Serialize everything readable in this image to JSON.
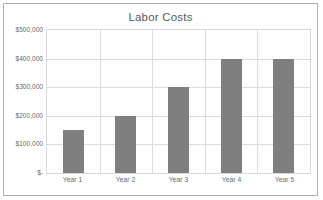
{
  "chart_data": {
    "type": "bar",
    "title": "Labor Costs",
    "xlabel": "",
    "ylabel": "",
    "categories": [
      "Year 1",
      "Year 2",
      "Year 3",
      "Year 4",
      "Year 5"
    ],
    "values": [
      150000,
      200000,
      300000,
      400000,
      400000
    ],
    "ylim": [
      0,
      500000
    ],
    "ytick_values": [
      0,
      100000,
      200000,
      300000,
      400000,
      500000
    ],
    "ytick_labels": [
      "$-",
      "$100,000",
      "$200,000",
      "$300,000",
      "$400,000",
      "$500,000"
    ],
    "grid": true,
    "legend": false,
    "series": [
      {
        "name": "Labor Costs",
        "values": [
          150000,
          200000,
          300000,
          400000,
          400000
        ],
        "color": "#7f7f7f"
      }
    ]
  },
  "colors": {
    "bar": "#7f7f7f",
    "grid": "#dcdcdc",
    "plot_border": "#d9d9d9",
    "frame_border": "#b0b0b0",
    "title_text": "#5a5a5a",
    "tick_text": "#6b6b6b",
    "background": "#ffffff"
  }
}
